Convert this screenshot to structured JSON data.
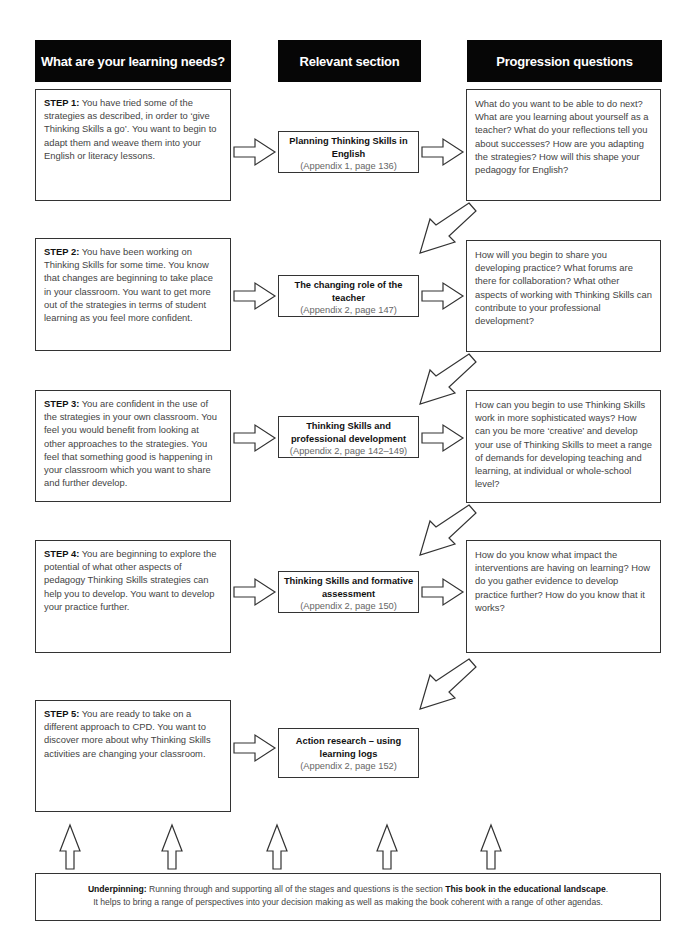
{
  "headers": {
    "learning_needs": "What are your learning needs?",
    "relevant_section": "Relevant section",
    "progression_questions": "Progression questions"
  },
  "rows": [
    {
      "step_label": "STEP 1:",
      "step_text": " You have tried some of the strategies as described, in order to ‘give Thinking Skills a go’. You want to begin to adapt them and weave them into your English or literacy lessons.",
      "section_title": "Planning Thinking Skills in English",
      "section_ref": "(Appendix 1, page 136)",
      "questions": "What do you want to be able to do next? What are you learning about yourself as a teacher? What do your reflections tell you about successes? How are you adapting the strategies? How will this shape your pedagogy for English?"
    },
    {
      "step_label": "STEP 2:",
      "step_text": " You have been working on Thinking Skills for some time. You know that changes are beginning to take place in your classroom. You want to get more out of the strategies in terms of student learning as you feel more confident.",
      "section_title": "The changing role of the teacher",
      "section_ref": "(Appendix 2, page 147)",
      "questions": "How will you begin to share you developing practice? What forums are there for collaboration? What other aspects of working with Thinking Skills can contribute to your professional development?"
    },
    {
      "step_label": "STEP 3:",
      "step_text": " You are confident in the use of the strategies in your own classroom. You feel you would benefit from looking at other approaches to the strategies. You feel that something good is happening in your classroom which you want to share and further develop.",
      "section_title": "Thinking Skills and professional development",
      "section_ref": "(Appendix 2, page 142–149)",
      "questions": "How can you begin to use Thinking Skills work in more sophisticated ways? How can you be more ‘creative’ and develop your use of Thinking Skills to meet a range of demands for developing teaching and learning, at individual or whole-school level?"
    },
    {
      "step_label": "STEP 4:",
      "step_text": " You are beginning to explore the potential of what other aspects of pedagogy Thinking Skills strategies can help you to develop. You want to develop your practice further.",
      "section_title": "Thinking Skills and formative assessment",
      "section_ref": "(Appendix 2, page 150)",
      "questions": "How do you know what impact the interventions are having on learning? How do you gather evidence to develop practice further? How do you know that it works?"
    },
    {
      "step_label": "STEP 5:",
      "step_text": " You are ready to take on a different approach to CPD. You want to discover more about why Thinking Skills activities are changing your classroom.",
      "section_title": "Action research – using learning logs",
      "section_ref": "(Appendix 2, page 152)"
    }
  ],
  "underpinning": {
    "label": "Underpinning:",
    "text_before": " Running through and supporting all of the stages and questions is the section ",
    "section_name": "This book in the educational landscape",
    "text_after": ".",
    "line2": "It helps to bring a range of perspectives into your decision making as well as making the book coherent with a range of other agendas."
  },
  "icons": {
    "right_arrow": "hollow-right-arrow",
    "diagonal_arrow": "hollow-down-left-arrow",
    "up_arrow": "hollow-up-arrow"
  }
}
